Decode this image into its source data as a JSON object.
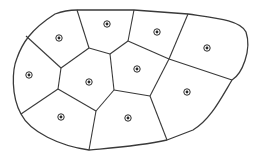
{
  "diagram": {
    "type": "voronoi",
    "stroke_color": "#3a3a3a",
    "seed_color": "#2a2a2a",
    "boundary": "M77,10 L134,10 L188,14 C215,18 240,20 246,32 C252,50 242,74 232,80 C220,100 210,120 193,130 L167,140 C140,146 110,148 89,150 C60,146 30,132 21,114 C11,96 12,70 17,58 C22,44 30,30 55,14 C63,11 70,10 77,10 Z",
    "edges": [
      {
        "d": "M77,10 L89,48"
      },
      {
        "d": "M89,48 L110,54"
      },
      {
        "d": "M110,54 L128,41"
      },
      {
        "d": "M128,41 L134,10"
      },
      {
        "d": "M128,41 L169,59"
      },
      {
        "d": "M169,59 L188,14"
      },
      {
        "d": "M169,59 L232,80"
      },
      {
        "d": "M169,59 L150,96"
      },
      {
        "d": "M150,96 L167,140"
      },
      {
        "d": "M150,96 L114,90"
      },
      {
        "d": "M114,90 L110,54"
      },
      {
        "d": "M114,90 L96,111"
      },
      {
        "d": "M96,111 L89,150"
      },
      {
        "d": "M96,111 L58,89"
      },
      {
        "d": "M58,89 L21,114"
      },
      {
        "d": "M58,89 L61,68"
      },
      {
        "d": "M61,68 L89,48"
      },
      {
        "d": "M61,68 L26,36"
      }
    ],
    "seeds": [
      {
        "x": 59,
        "y": 38
      },
      {
        "x": 107,
        "y": 24
      },
      {
        "x": 157,
        "y": 32
      },
      {
        "x": 207,
        "y": 48
      },
      {
        "x": 29,
        "y": 75
      },
      {
        "x": 89,
        "y": 82
      },
      {
        "x": 137,
        "y": 69
      },
      {
        "x": 187,
        "y": 92
      },
      {
        "x": 61,
        "y": 117
      },
      {
        "x": 128,
        "y": 118
      }
    ]
  }
}
